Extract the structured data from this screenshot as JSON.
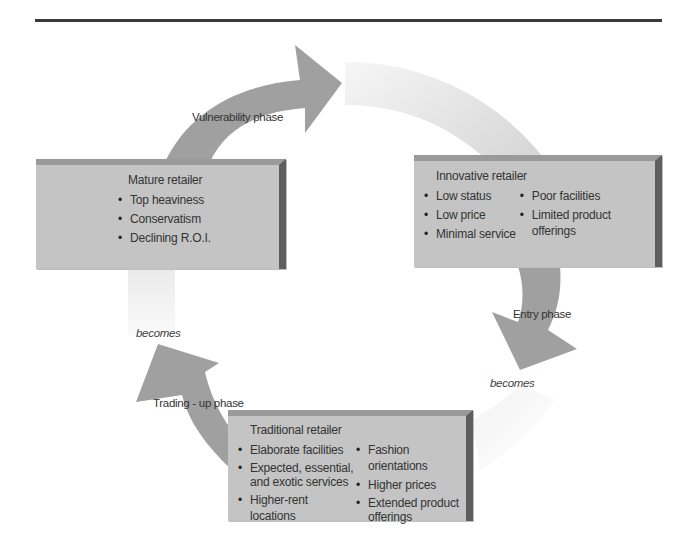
{
  "diagram": {
    "type": "wheel-of-retailing cycle",
    "stages": {
      "mature": {
        "title": "Mature retailer",
        "bullets": [
          "Top heaviness",
          "Conservatism",
          "Declining R.O.I."
        ]
      },
      "innovative": {
        "title": "Innovative retailer",
        "bullets_left": [
          "Low status",
          "Low price",
          "Minimal service"
        ],
        "bullets_right": [
          "Poor facilities",
          "Limited product offerings"
        ]
      },
      "traditional": {
        "title": "Traditional retailer",
        "bullets_left": [
          "Elaborate facilities",
          "Expected, essential, and exotic services",
          "Higher-rent locations"
        ],
        "bullets_right": [
          "Fashion orientations",
          "Higher prices",
          "Extended product offerings"
        ]
      }
    },
    "phases": {
      "vulnerability": "Vulnerability phase",
      "entry": "Entry phase",
      "trading_up": "Trading - up phase"
    },
    "connectors": {
      "becomes_left": "becomes",
      "becomes_right": "becomes"
    },
    "colors": {
      "box_fill": "#c4c4c4",
      "arrow_fill": "#9e9e9e",
      "ring_light": "#ececec"
    }
  }
}
